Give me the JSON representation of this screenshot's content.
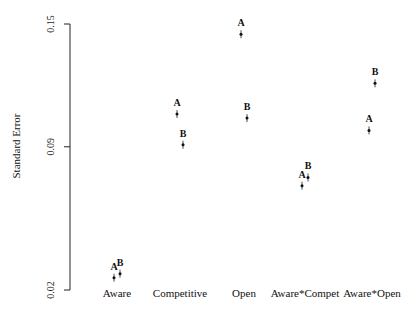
{
  "chart_data": {
    "type": "scatter",
    "title": "",
    "xlabel": "",
    "ylabel": "Standard Error",
    "ylim": [
      0.02,
      0.15
    ],
    "yticks": [
      0.02,
      0.09,
      0.15
    ],
    "ytick_labels": [
      "0.02",
      "0.09",
      "0.15"
    ],
    "grid": false,
    "legend": null,
    "categories": [
      "Aware",
      "Competitive",
      "Open",
      "Aware*Compet",
      "Aware*Open"
    ],
    "series": [
      {
        "name": "A",
        "values": [
          0.026,
          0.106,
          0.145,
          0.071,
          0.098
        ]
      },
      {
        "name": "B",
        "values": [
          0.028,
          0.091,
          0.104,
          0.075,
          0.121
        ]
      }
    ]
  },
  "layout": {
    "axis_x": 70,
    "y_top_px": 24,
    "y_bottom_px": 290,
    "category_x": [
      117,
      180,
      244,
      305,
      372
    ],
    "series_offsets": {
      "A": -3,
      "B": 3
    }
  }
}
